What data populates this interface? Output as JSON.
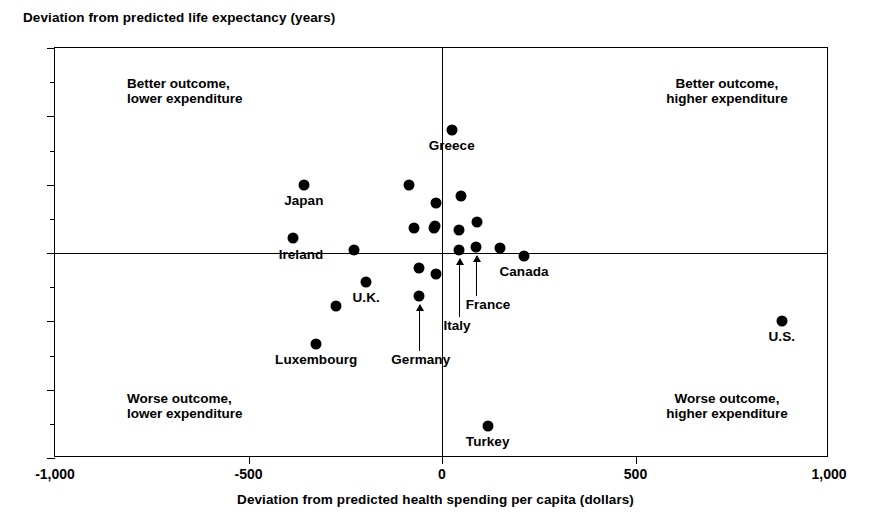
{
  "chart_data": {
    "type": "scatter",
    "title": "",
    "ylabel": "Deviation from predicted life expectancy (years)",
    "xlabel": "Deviation from predicted health spending per capita (dollars)",
    "xlim": [
      -1000,
      1000
    ],
    "ylim": [
      -6,
      6
    ],
    "x_ticks": [
      -1000,
      -500,
      0,
      500,
      1000
    ],
    "x_tick_labels": [
      "-1,000",
      "-500",
      "0",
      "500",
      "1,000"
    ],
    "y_ticks": [
      -6,
      -4,
      -2,
      0,
      2,
      4,
      6
    ],
    "y_tick_labels": [
      "-6",
      "-4",
      "-2",
      "0",
      "2",
      "4",
      "6"
    ],
    "y_minor_ticks": [
      -5,
      -3,
      -1,
      1,
      3,
      5
    ],
    "grid": false,
    "legend": "none",
    "zero_lines": {
      "x": 0,
      "y": 0
    },
    "points": [
      {
        "label": "Japan",
        "x": -357,
        "y": 2.0,
        "label_pos": "below"
      },
      {
        "label": "Ireland",
        "x": -385,
        "y": 0.45,
        "label_pos": "below-right"
      },
      {
        "label": "",
        "x": -227,
        "y": 0.08
      },
      {
        "label": "",
        "x": -273,
        "y": -1.55
      },
      {
        "label": "U.K.",
        "x": -196,
        "y": -0.85,
        "label_pos": "below"
      },
      {
        "label": "Luxembourg",
        "x": -325,
        "y": -2.65,
        "label_pos": "below"
      },
      {
        "label": "",
        "x": -85,
        "y": 2.0
      },
      {
        "label": "",
        "x": -73,
        "y": 0.72
      },
      {
        "label": "",
        "x": -60,
        "y": -0.45
      },
      {
        "label": "Germany",
        "x": -60,
        "y": -1.25,
        "label_pos": "arrow-below"
      },
      {
        "label": "",
        "x": -16,
        "y": 1.45
      },
      {
        "label": "",
        "x": -18,
        "y": 0.8
      },
      {
        "label": "",
        "x": -21,
        "y": 0.72
      },
      {
        "label": "",
        "x": -16,
        "y": -0.62
      },
      {
        "label": "Greece",
        "x": 25,
        "y": 3.6,
        "label_pos": "below"
      },
      {
        "label": "",
        "x": 48,
        "y": 1.68
      },
      {
        "label": "",
        "x": 44,
        "y": 0.68
      },
      {
        "label": "Italy",
        "x": 44,
        "y": 0.1,
        "label_pos": "arrow-below"
      },
      {
        "label": "",
        "x": 90,
        "y": 0.92
      },
      {
        "label": "France",
        "x": 88,
        "y": 0.18,
        "label_pos": "arrow-below"
      },
      {
        "label": "",
        "x": 150,
        "y": 0.14
      },
      {
        "label": "Canada",
        "x": 212,
        "y": -0.08,
        "label_pos": "below"
      },
      {
        "label": "Turkey",
        "x": 118,
        "y": -5.05,
        "label_pos": "below"
      },
      {
        "label": "U.S.",
        "x": 878,
        "y": -2.0,
        "label_pos": "below"
      }
    ],
    "annotations": [
      {
        "name": "better-lower",
        "text_line1": "Better outcome,",
        "text_line2": "lower expenditure",
        "quadrant": "top-left"
      },
      {
        "name": "better-higher",
        "text_line1": "Better outcome,",
        "text_line2": "higher expenditure",
        "quadrant": "top-right"
      },
      {
        "name": "worse-lower",
        "text_line1": "Worse outcome,",
        "text_line2": "lower expenditure",
        "quadrant": "bottom-left"
      },
      {
        "name": "worse-higher",
        "text_line1": "Worse outcome,",
        "text_line2": "higher expenditure",
        "quadrant": "bottom-right"
      }
    ]
  }
}
